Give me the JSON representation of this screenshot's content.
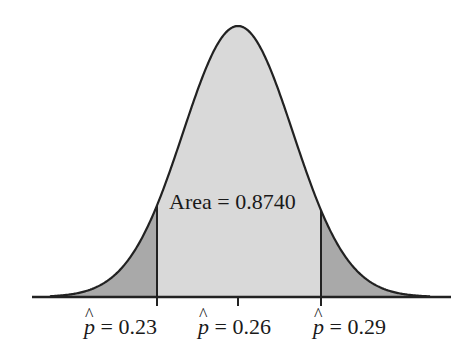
{
  "chart_data": {
    "type": "area",
    "title": "",
    "mean": 0.26,
    "sd": 0.0196,
    "shaded_center": {
      "from": 0.23,
      "to": 0.29,
      "area": 0.874
    },
    "tick_labels": [
      "p̂ = 0.23",
      "p̂ = 0.26",
      "p̂ = 0.29"
    ],
    "tick_values": [
      0.23,
      0.26,
      0.29
    ],
    "annotation": "Area = 0.8740",
    "colors": {
      "center": "#d9d9d9",
      "tails": "#a9a9a9",
      "line": "#222222"
    },
    "grid": false
  },
  "labels": {
    "area": "Area = 0.8740",
    "tick1_val": "= 0.23",
    "tick2_val": "= 0.26",
    "tick3_val": "= 0.29",
    "phat": "p"
  }
}
